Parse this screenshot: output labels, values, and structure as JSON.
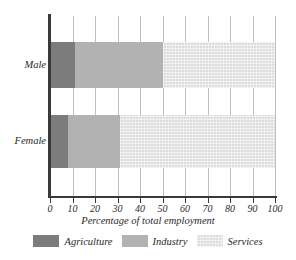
{
  "chart_data": {
    "type": "bar",
    "orientation": "horizontal",
    "stacked": true,
    "title": "",
    "xlabel": "Percentage of total employment",
    "ylabel": "",
    "categories": [
      "Male",
      "Female"
    ],
    "xlim": [
      0,
      100
    ],
    "xticks": [
      0,
      10,
      20,
      30,
      40,
      50,
      60,
      70,
      80,
      90,
      100
    ],
    "xtick_labels": [
      "0",
      "10",
      "20",
      "30",
      "40",
      "50",
      "60",
      "70",
      "80",
      "90",
      "100"
    ],
    "grid": true,
    "grid_axis": "x",
    "legend_position": "bottom",
    "series": [
      {
        "name": "Agriculture",
        "color": "#7c7c7c",
        "values": [
          11,
          8
        ]
      },
      {
        "name": "Industry",
        "color": "#b2b2b2",
        "values": [
          39,
          23
        ]
      },
      {
        "name": "Services",
        "color": "#dddddd",
        "values": [
          50,
          69
        ]
      }
    ],
    "cumulative_boundaries": {
      "Male": [
        11,
        50,
        100
      ],
      "Female": [
        8,
        31,
        100
      ]
    }
  },
  "axis": {
    "x_title": "Percentage of total employment"
  },
  "category_labels": {
    "male": "Male",
    "female": "Female"
  },
  "legend": {
    "items": [
      {
        "label": "Agriculture"
      },
      {
        "label": "Industry"
      },
      {
        "label": "Services"
      }
    ]
  }
}
